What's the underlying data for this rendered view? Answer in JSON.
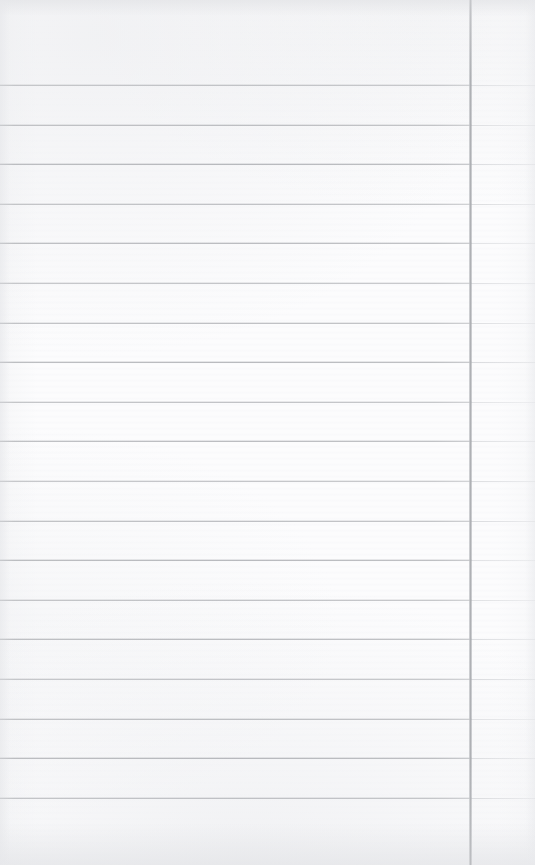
{
  "document": {
    "kind": "scanned-lined-notebook-page",
    "title": "Blank Ruled Notebook Page",
    "page_width": 535,
    "page_height": 865,
    "has_text_content": false,
    "handwriting_present": false,
    "printed_text_present": false,
    "visible_text": ""
  },
  "colors": {
    "paper_background": "#fcfcfd",
    "rule_line": "#a2a4a9",
    "rule_line_faded": "#c6c8cc",
    "margin_rule": "#abadb1",
    "page_edge_shadow": "#e4e5e8"
  },
  "ruling": {
    "style": "wide-ruled",
    "line_count": 19,
    "line_spacing_px": 39.6,
    "first_line_y": 85,
    "last_line_y": 798,
    "line_thickness_px": 1,
    "orientation": "horizontal",
    "lines_y": [
      85,
      124.6,
      164.2,
      203.8,
      243.4,
      283,
      322.6,
      362.2,
      401.8,
      441.4,
      481,
      520.6,
      560.2,
      599.8,
      639.4,
      679,
      718.6,
      758.2,
      797.8
    ]
  },
  "margin": {
    "present": true,
    "orientation": "vertical",
    "position_x": 470,
    "thickness_px": 3,
    "spans_full_height": true,
    "side": "right",
    "label": "right margin rule"
  },
  "regions": {
    "header_area": {
      "label": "top header area above first rule",
      "y_start": 0,
      "y_end": 85
    },
    "writing_area": {
      "label": "main writing area",
      "y_start": 85,
      "y_end": 798
    },
    "footer_area": {
      "label": "bottom blank area below last rule",
      "y_start": 798,
      "y_end": 865
    },
    "right_column": {
      "label": "narrow column right of margin rule",
      "x_start": 470,
      "x_end": 535
    }
  }
}
